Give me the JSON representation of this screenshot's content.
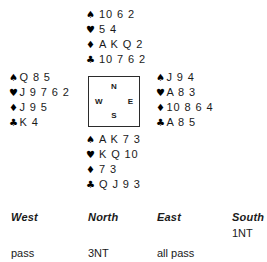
{
  "diagram": {
    "type": "bridge-deal",
    "suit_symbols": {
      "spade": "♠",
      "heart": "♥",
      "diamond": "♦",
      "club": "♣"
    },
    "compass": {
      "north": "N",
      "west": "W",
      "east": "E",
      "south": "S"
    },
    "hands": {
      "north": {
        "spades": "10 6 2",
        "hearts": "5 4",
        "diamonds": "A K Q 2",
        "clubs": "10 7 6 2"
      },
      "west": {
        "spades": "Q 8 5",
        "hearts": "J 9 7 6 2",
        "diamonds": "J 9 5",
        "clubs": "K 4"
      },
      "east": {
        "spades": "J 9 4",
        "hearts": "A 8 3",
        "diamonds": "10 8 6 4",
        "clubs": "A 8 5"
      },
      "south": {
        "spades": "A K 7 3",
        "hearts": "K Q 10",
        "diamonds": "7 3",
        "clubs": "Q J 9 3"
      }
    }
  },
  "auction": {
    "headers": {
      "west": "West",
      "north": "North",
      "east": "East",
      "south": "South"
    },
    "rows": [
      {
        "west": "",
        "north": "",
        "east": "",
        "south": "1NT"
      },
      {
        "west": "pass",
        "north": "3NT",
        "east": "all pass",
        "south": ""
      }
    ]
  },
  "colors": {
    "text": "#1a1a1a",
    "background": "#ffffff",
    "border": "#2b2b2b"
  }
}
